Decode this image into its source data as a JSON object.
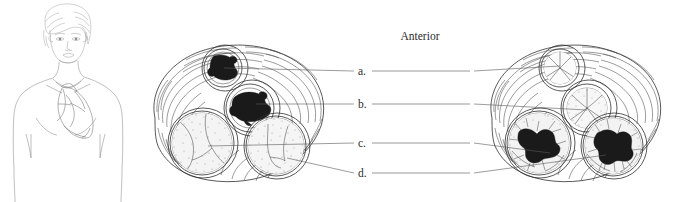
{
  "figure": {
    "orientation_label": "Anterior",
    "labels": [
      {
        "key": "a.",
        "name": "label-a"
      },
      {
        "key": "b.",
        "name": "label-b"
      },
      {
        "key": "c.",
        "name": "label-c"
      },
      {
        "key": "d.",
        "name": "label-d"
      }
    ],
    "panels": [
      {
        "name": "left-panel",
        "description": "superior view of heart base, valves during ventricular systole",
        "valves": [
          {
            "name": "pulmonary-valve-closed",
            "state": "closed"
          },
          {
            "name": "aortic-valve-closed",
            "state": "closed"
          },
          {
            "name": "tricuspid-valve-closed",
            "state": "closed"
          },
          {
            "name": "mitral-valve-closed",
            "state": "closed"
          }
        ]
      },
      {
        "name": "right-panel",
        "description": "superior view of heart base, valves during ventricular diastole",
        "valves": [
          {
            "name": "pulmonary-valve-open",
            "state": "open"
          },
          {
            "name": "aortic-valve-open",
            "state": "open"
          },
          {
            "name": "tricuspid-valve-open",
            "state": "open"
          },
          {
            "name": "mitral-valve-open",
            "state": "open"
          }
        ]
      }
    ],
    "inset": {
      "name": "body-orientation-inset",
      "description": "anterior view of female torso showing heart position"
    },
    "colors": {
      "ink": "#4a4a4a",
      "dark_ink": "#2e2e2e",
      "valve_fill": "#1a1a1a",
      "text": "#2b2b2b",
      "background": "#ffffff"
    }
  }
}
